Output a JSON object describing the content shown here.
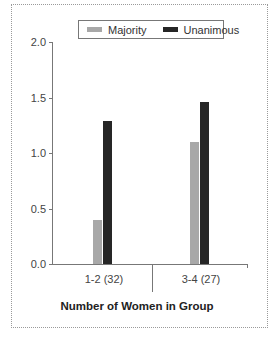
{
  "chart_data": {
    "type": "bar",
    "title": "",
    "xlabel": "Number of Women in Group",
    "ylabel": "",
    "categories": [
      "1-2 (32)",
      "3-4 (27)"
    ],
    "series": [
      {
        "name": "Majority",
        "values": [
          0.4,
          1.1
        ],
        "color": "#a8a8a8"
      },
      {
        "name": "Unanimous",
        "values": [
          1.29,
          1.46
        ],
        "color": "#262626"
      }
    ],
    "ylim": [
      0.0,
      2.0
    ],
    "yticks": [
      "0.0",
      "0.5",
      "1.0",
      "1.5",
      "2.0"
    ],
    "grid": false,
    "legend_position": "top-center"
  },
  "legend": {
    "items": [
      {
        "label": "Majority",
        "color": "#a8a8a8"
      },
      {
        "label": "Unanimous",
        "color": "#262626"
      }
    ]
  },
  "axes": {
    "x_title": "Number of Women in Group",
    "x_categories": [
      "1-2 (32)",
      "3-4 (27)"
    ],
    "y_ticks": [
      "2.0",
      "1.5",
      "1.0",
      "0.5",
      "0.0"
    ]
  }
}
